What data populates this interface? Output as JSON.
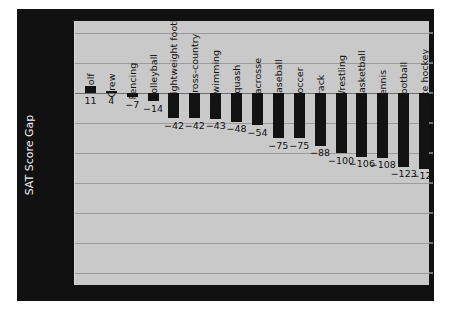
{
  "chart_data": {
    "type": "bar",
    "title": "",
    "xlabel": "",
    "ylabel": "SAT Score Gap",
    "ylim": [
      -320,
      120
    ],
    "yticks": [
      100,
      50,
      0,
      -50,
      -100,
      -150,
      -200,
      -250,
      -300
    ],
    "ytick_labels": [
      "100",
      "50",
      "0",
      "−50",
      "−100",
      "−150",
      "−200",
      "−250",
      "−300"
    ],
    "grid": true,
    "legend": "none",
    "categories": [
      "Golf",
      "Crew",
      "Fencing",
      "Volleyball",
      "Lightweight football",
      "Cross-country",
      "Swimming",
      "Squash",
      "Lacrosse",
      "Baseball",
      "Soccer",
      "Track",
      "Wrestling",
      "Basketball",
      "Tennis",
      "Football",
      "Ice hockey"
    ],
    "values": [
      11,
      4,
      -7,
      -14,
      -42,
      -42,
      -43,
      -48,
      -54,
      -75,
      -75,
      -88,
      -100,
      -106,
      -108,
      -123,
      -126
    ],
    "value_labels": [
      "11",
      "4",
      "−7",
      "−14",
      "−42",
      "−42",
      "−43",
      "−48",
      "−54",
      "−75",
      "−75",
      "−88",
      "−100",
      "−106",
      "−108",
      "−123",
      "−126"
    ],
    "colors": {
      "bar": "#131313",
      "plot_background": "#c9c9c9",
      "axis_panel": "#111111",
      "gridline": "#9b9b9b",
      "axis_text": "#f2f2f2",
      "label_text": "#111111"
    }
  }
}
